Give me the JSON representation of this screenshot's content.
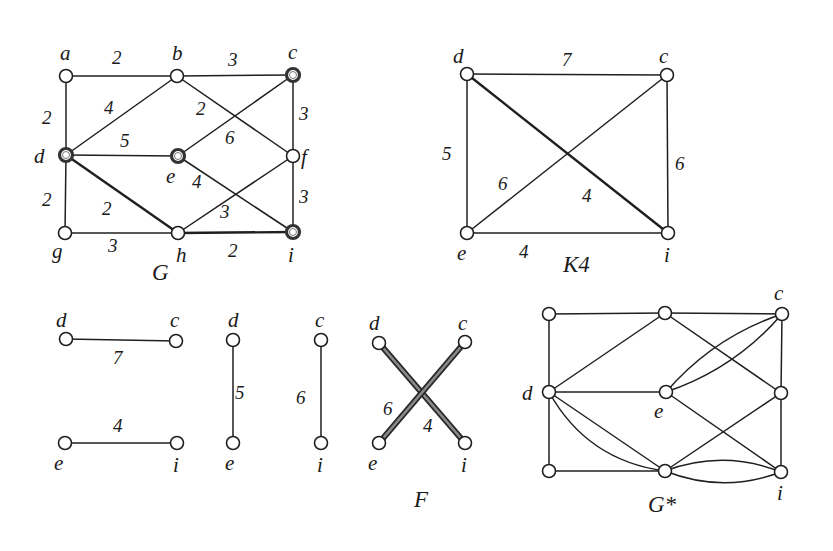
{
  "figure": {
    "graphs": [
      {
        "id": "G",
        "title": "G",
        "title_pos": [
          152,
          280
        ],
        "nodes": [
          {
            "id": "a",
            "x": 66,
            "y": 76,
            "label": "a",
            "lx": 60,
            "ly": 60,
            "special": false
          },
          {
            "id": "b",
            "x": 177,
            "y": 76,
            "label": "b",
            "lx": 172,
            "ly": 60,
            "special": false
          },
          {
            "id": "c",
            "x": 293,
            "y": 75,
            "label": "c",
            "lx": 288,
            "ly": 59,
            "special": true
          },
          {
            "id": "d",
            "x": 66,
            "y": 155,
            "label": "d",
            "lx": 34,
            "ly": 163,
            "special": true
          },
          {
            "id": "e",
            "x": 178,
            "y": 156,
            "label": "e",
            "lx": 166,
            "ly": 183,
            "special": true
          },
          {
            "id": "f",
            "x": 293,
            "y": 156,
            "label": "f",
            "lx": 301,
            "ly": 164,
            "special": false
          },
          {
            "id": "g",
            "x": 65,
            "y": 233,
            "label": "g",
            "lx": 52,
            "ly": 258,
            "special": false
          },
          {
            "id": "h",
            "x": 178,
            "y": 233,
            "label": "h",
            "lx": 176,
            "ly": 262,
            "special": false
          },
          {
            "id": "i",
            "x": 293,
            "y": 232,
            "label": "i",
            "lx": 288,
            "ly": 262,
            "special": true
          }
        ],
        "edges": [
          {
            "from": "a",
            "to": "b",
            "weight": "2",
            "wx": 112,
            "wy": 64,
            "bold": false
          },
          {
            "from": "b",
            "to": "c",
            "weight": "3",
            "wx": 228,
            "wy": 66,
            "bold": false
          },
          {
            "from": "a",
            "to": "d",
            "weight": "2",
            "wx": 42,
            "wy": 124,
            "bold": false
          },
          {
            "from": "b",
            "to": "d",
            "weight": "4",
            "wx": 104,
            "wy": 114,
            "bold": false
          },
          {
            "from": "b",
            "to": "f",
            "weight": "2",
            "wx": 196,
            "wy": 115,
            "bold": false
          },
          {
            "from": "c",
            "to": "e",
            "weight": "6",
            "wx": 225,
            "wy": 144,
            "bold": false
          },
          {
            "from": "c",
            "to": "f",
            "weight": "3",
            "wx": 299,
            "wy": 120,
            "bold": false
          },
          {
            "from": "d",
            "to": "e",
            "weight": "5",
            "wx": 120,
            "wy": 147,
            "bold": false
          },
          {
            "from": "d",
            "to": "g",
            "weight": "2",
            "wx": 42,
            "wy": 206,
            "bold": false
          },
          {
            "from": "d",
            "to": "h",
            "weight": "2",
            "wx": 102,
            "wy": 215,
            "bold": true
          },
          {
            "from": "e",
            "to": "i",
            "weight": "4",
            "wx": 192,
            "wy": 188,
            "bold": false
          },
          {
            "from": "f",
            "to": "h",
            "weight": "3",
            "wx": 220,
            "wy": 218,
            "bold": false
          },
          {
            "from": "f",
            "to": "i",
            "weight": "3",
            "wx": 299,
            "wy": 203,
            "bold": false
          },
          {
            "from": "g",
            "to": "h",
            "weight": "3",
            "wx": 108,
            "wy": 252,
            "bold": false
          },
          {
            "from": "h",
            "to": "i",
            "weight": "2",
            "wx": 228,
            "wy": 257,
            "bold": true
          }
        ]
      },
      {
        "id": "K4",
        "title": "K4",
        "title_pos": [
          563,
          272
        ],
        "nodes": [
          {
            "id": "d",
            "x": 467,
            "y": 74,
            "label": "d",
            "lx": 453,
            "ly": 63,
            "special": false
          },
          {
            "id": "c",
            "x": 667,
            "y": 75,
            "label": "c",
            "lx": 659,
            "ly": 63,
            "special": false
          },
          {
            "id": "e",
            "x": 467,
            "y": 233,
            "label": "e",
            "lx": 457,
            "ly": 260,
            "special": false
          },
          {
            "id": "i",
            "x": 668,
            "y": 233,
            "label": "i",
            "lx": 664,
            "ly": 262,
            "special": false
          }
        ],
        "edges": [
          {
            "from": "d",
            "to": "c",
            "weight": "7",
            "wx": 562,
            "wy": 66,
            "bold": false
          },
          {
            "from": "d",
            "to": "e",
            "weight": "5",
            "wx": 442,
            "wy": 160,
            "bold": false
          },
          {
            "from": "c",
            "to": "i",
            "weight": "6",
            "wx": 675,
            "wy": 170,
            "bold": false
          },
          {
            "from": "e",
            "to": "i",
            "weight": "4",
            "wx": 519,
            "wy": 258,
            "bold": false
          },
          {
            "from": "d",
            "to": "i",
            "weight": "4",
            "wx": 582,
            "wy": 202,
            "bold": true
          },
          {
            "from": "e",
            "to": "c",
            "weight": "6",
            "wx": 498,
            "wy": 190,
            "bold": false
          }
        ]
      },
      {
        "id": "P1",
        "title": "",
        "title_pos": [
          0,
          0
        ],
        "nodes": [
          {
            "id": "d",
            "x": 66,
            "y": 339,
            "label": "d",
            "lx": 56,
            "ly": 327,
            "special": false
          },
          {
            "id": "c",
            "x": 176,
            "y": 341,
            "label": "c",
            "lx": 170,
            "ly": 327,
            "special": false
          },
          {
            "id": "e",
            "x": 65,
            "y": 443,
            "label": "e",
            "lx": 54,
            "ly": 470,
            "special": false
          },
          {
            "id": "i",
            "x": 177,
            "y": 443,
            "label": "i",
            "lx": 173,
            "ly": 472,
            "special": false
          }
        ],
        "edges": [
          {
            "from": "d",
            "to": "c",
            "weight": "7",
            "wx": 113,
            "wy": 364,
            "bold": false
          },
          {
            "from": "e",
            "to": "i",
            "weight": "4",
            "wx": 113,
            "wy": 432,
            "bold": false
          }
        ]
      },
      {
        "id": "P2",
        "title": "",
        "title_pos": [
          0,
          0
        ],
        "nodes": [
          {
            "id": "d",
            "x": 233,
            "y": 340,
            "label": "d",
            "lx": 228,
            "ly": 327,
            "special": false
          },
          {
            "id": "e",
            "x": 233,
            "y": 443,
            "label": "e",
            "lx": 225,
            "ly": 470,
            "special": false
          }
        ],
        "edges": [
          {
            "from": "d",
            "to": "e",
            "weight": "5",
            "wx": 235,
            "wy": 399,
            "bold": false
          }
        ]
      },
      {
        "id": "P3",
        "title": "",
        "title_pos": [
          0,
          0
        ],
        "nodes": [
          {
            "id": "c",
            "x": 321,
            "y": 340,
            "label": "c",
            "lx": 315,
            "ly": 327,
            "special": false
          },
          {
            "id": "i",
            "x": 321,
            "y": 443,
            "label": "i",
            "lx": 317,
            "ly": 472,
            "special": false
          }
        ],
        "edges": [
          {
            "from": "c",
            "to": "i",
            "weight": "6",
            "wx": 296,
            "wy": 404,
            "bold": false
          }
        ]
      },
      {
        "id": "F",
        "title": "F",
        "title_pos": [
          414,
          507
        ],
        "nodes": [
          {
            "id": "d",
            "x": 379,
            "y": 343,
            "label": "d",
            "lx": 369,
            "ly": 330,
            "special": false
          },
          {
            "id": "c",
            "x": 465,
            "y": 342,
            "label": "c",
            "lx": 458,
            "ly": 330,
            "special": false
          },
          {
            "id": "e",
            "x": 379,
            "y": 443,
            "label": "e",
            "lx": 368,
            "ly": 470,
            "special": false
          },
          {
            "id": "i",
            "x": 465,
            "y": 443,
            "label": "i",
            "lx": 461,
            "ly": 472,
            "special": false
          }
        ],
        "edges": [
          {
            "from": "d",
            "to": "i",
            "weight": "4",
            "wx": 423,
            "wy": 432,
            "bold": true
          },
          {
            "from": "c",
            "to": "e",
            "weight": "6",
            "wx": 383,
            "wy": 415,
            "bold": true
          }
        ]
      },
      {
        "id": "Gstar",
        "title": "G*",
        "title_pos": [
          648,
          512
        ],
        "nodes": [
          {
            "id": "a",
            "x": 549,
            "y": 314,
            "label": "",
            "lx": 0,
            "ly": 0,
            "special": false
          },
          {
            "id": "b",
            "x": 665,
            "y": 313,
            "label": "",
            "lx": 0,
            "ly": 0,
            "special": false
          },
          {
            "id": "c",
            "x": 782,
            "y": 314,
            "label": "c",
            "lx": 774,
            "ly": 300,
            "special": false
          },
          {
            "id": "d",
            "x": 549,
            "y": 392,
            "label": "d",
            "lx": 522,
            "ly": 400,
            "special": false
          },
          {
            "id": "e",
            "x": 666,
            "y": 392,
            "label": "e",
            "lx": 654,
            "ly": 418,
            "special": false
          },
          {
            "id": "f",
            "x": 781,
            "y": 393,
            "label": "",
            "lx": 0,
            "ly": 0,
            "special": false
          },
          {
            "id": "g",
            "x": 549,
            "y": 471,
            "label": "",
            "lx": 0,
            "ly": 0,
            "special": false
          },
          {
            "id": "h",
            "x": 665,
            "y": 471,
            "label": "",
            "lx": 0,
            "ly": 0,
            "special": false
          },
          {
            "id": "i",
            "x": 781,
            "y": 472,
            "label": "i",
            "lx": 777,
            "ly": 500,
            "special": false
          }
        ],
        "edges": [
          {
            "from": "a",
            "to": "b",
            "curve": 0
          },
          {
            "from": "b",
            "to": "c",
            "curve": 0
          },
          {
            "from": "a",
            "to": "d",
            "curve": 0
          },
          {
            "from": "b",
            "to": "d",
            "curve": 0
          },
          {
            "from": "b",
            "to": "f",
            "curve": 0
          },
          {
            "from": "c",
            "to": "f",
            "curve": 0
          },
          {
            "from": "d",
            "to": "e",
            "curve": 0
          },
          {
            "from": "d",
            "to": "g",
            "curve": 0
          },
          {
            "from": "d",
            "to": "h",
            "curve": 0
          },
          {
            "from": "d",
            "to": "h",
            "curve": 22
          },
          {
            "from": "e",
            "to": "c",
            "curve": 12
          },
          {
            "from": "e",
            "to": "c",
            "curve": -12
          },
          {
            "from": "e",
            "to": "i",
            "curve": 0
          },
          {
            "from": "f",
            "to": "h",
            "curve": 0
          },
          {
            "from": "f",
            "to": "i",
            "curve": 0
          },
          {
            "from": "g",
            "to": "h",
            "curve": 0
          },
          {
            "from": "h",
            "to": "i",
            "curve": 14
          },
          {
            "from": "h",
            "to": "i",
            "curve": -14
          }
        ]
      }
    ]
  }
}
